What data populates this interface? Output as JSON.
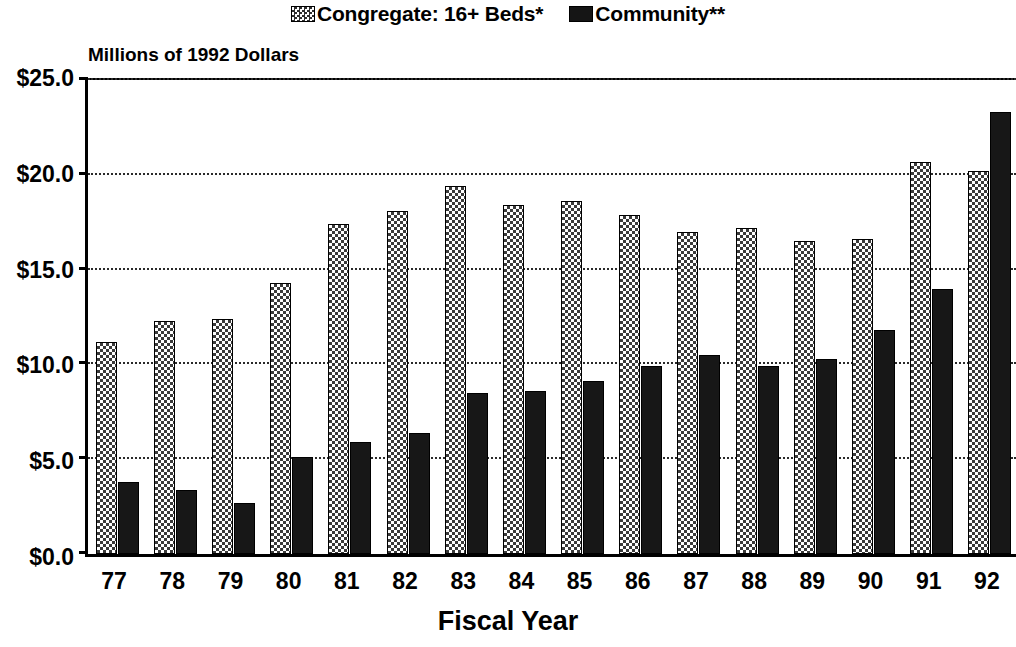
{
  "chart_data": {
    "type": "bar",
    "title": "",
    "subtitle": "",
    "ylabel": "Millions of 1992 Dollars",
    "xlabel": "Fiscal Year",
    "ylim": [
      0,
      25
    ],
    "ytick_values": [
      0,
      5,
      10,
      15,
      20,
      25
    ],
    "ytick_labels": [
      "$0.0",
      "$5.0",
      "$10.0",
      "$15.0",
      "$20.0",
      "$25.0"
    ],
    "grid": true,
    "grid_axis": "y",
    "legend_position": "top-center",
    "categories": [
      "77",
      "78",
      "79",
      "80",
      "81",
      "82",
      "83",
      "84",
      "85",
      "86",
      "87",
      "88",
      "89",
      "90",
      "91",
      "92"
    ],
    "series": [
      {
        "name": "Congregate: 16+ Beds*",
        "color": "#3a3a3a",
        "pattern": "checkered",
        "values": [
          11.2,
          12.3,
          12.4,
          14.3,
          17.4,
          18.1,
          19.4,
          18.4,
          18.6,
          17.9,
          17.0,
          17.2,
          16.5,
          16.6,
          20.7,
          20.2
        ]
      },
      {
        "name": "Community**",
        "color": "#171717",
        "pattern": "solid",
        "values": [
          3.8,
          3.4,
          2.7,
          5.1,
          5.9,
          6.4,
          8.5,
          8.6,
          9.1,
          9.9,
          10.5,
          9.9,
          10.3,
          11.8,
          14.0,
          23.3
        ]
      }
    ],
    "annotations": []
  },
  "legend": {
    "entries": [
      {
        "label": "Congregate: 16+ Beds*",
        "swatch": "checkered-swatch-icon"
      },
      {
        "label": "Community**",
        "swatch": "solid-swatch-icon"
      }
    ]
  },
  "axes": {
    "y_title": "Millions of 1992 Dollars",
    "x_title": "Fiscal Year"
  }
}
